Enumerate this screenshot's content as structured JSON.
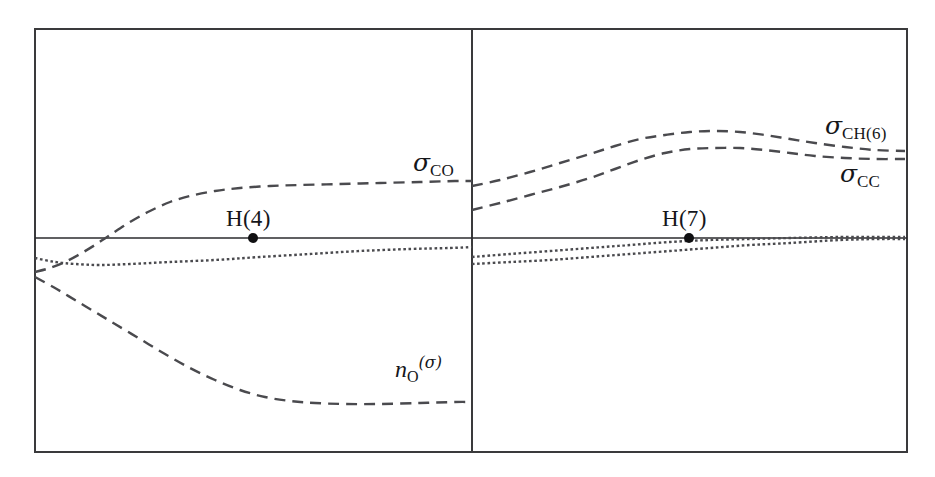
{
  "figure": {
    "background_color": "#ffffff",
    "frame_color": "#3a3a3c",
    "curve_color": "#4a4a4e",
    "axis_color": "#2b2b2e",
    "marker_color": "#101012"
  },
  "labels": {
    "sigma_co": {
      "symbol": "σ",
      "subscript": "CO",
      "x": 413,
      "y": 150
    },
    "n_o_sigma": {
      "symbol": "n",
      "subscript": "O",
      "superscript": "(σ)",
      "x": 395,
      "y": 355
    },
    "sigma_ch6": {
      "symbol": "σ",
      "subscript": "CH(6)",
      "x": 825,
      "y": 113
    },
    "sigma_cc": {
      "symbol": "σ",
      "subscript": "CC",
      "x": 840,
      "y": 161
    },
    "h4": {
      "text": "H(4)",
      "x": 226,
      "y": 207
    },
    "h7": {
      "text": "H(7)",
      "x": 662,
      "y": 207
    }
  },
  "chart_data": {
    "type": "line",
    "title": "",
    "xlabel": "",
    "ylabel": "",
    "grid": false,
    "legend": "inline-annotations",
    "axis_ranges": {
      "x_px": [
        35,
        907
      ],
      "y_px": [
        29,
        452
      ]
    },
    "baseline_y_px": 238,
    "panel_divider_x_px": 472,
    "panels": [
      {
        "name": "left-panel",
        "x_px": [
          35,
          472
        ],
        "series": [
          {
            "name": "σ_CO",
            "label": "σCO",
            "style": "dashed",
            "points_px": [
              [
                35,
                272
              ],
              [
                50,
                268
              ],
              [
                65,
                262
              ],
              [
                80,
                254
              ],
              [
                95,
                245
              ],
              [
                110,
                235
              ],
              [
                130,
                222
              ],
              [
                150,
                211
              ],
              [
                170,
                202
              ],
              [
                190,
                196
              ],
              [
                215,
                191
              ],
              [
                240,
                188
              ],
              [
                270,
                186
              ],
              [
                300,
                185
              ],
              [
                340,
                184
              ],
              [
                380,
                183
              ],
              [
                420,
                182
              ],
              [
                455,
                181
              ],
              [
                472,
                181
              ]
            ]
          },
          {
            "name": "n_O(σ)",
            "label": "nO(σ)",
            "style": "dashed",
            "points_px": [
              [
                35,
                277
              ],
              [
                55,
                288
              ],
              [
                75,
                300
              ],
              [
                95,
                312
              ],
              [
                115,
                324
              ],
              [
                140,
                339
              ],
              [
                165,
                354
              ],
              [
                190,
                368
              ],
              [
                215,
                380
              ],
              [
                240,
                390
              ],
              [
                265,
                397
              ],
              [
                290,
                401
              ],
              [
                315,
                403
              ],
              [
                345,
                404
              ],
              [
                380,
                404
              ],
              [
                420,
                403
              ],
              [
                455,
                402
              ],
              [
                472,
                402
              ]
            ]
          },
          {
            "name": "dotted-1",
            "label": "",
            "style": "dotted",
            "points_px": [
              [
                35,
                258
              ],
              [
                55,
                262
              ],
              [
                75,
                264
              ],
              [
                100,
                265
              ],
              [
                130,
                264
              ],
              [
                170,
                262
              ],
              [
                215,
                260
              ],
              [
                260,
                257
              ],
              [
                310,
                254
              ],
              [
                360,
                251
              ],
              [
                410,
                249
              ],
              [
                450,
                248
              ],
              [
                472,
                247
              ]
            ]
          }
        ],
        "markers": [
          {
            "label": "H(4)",
            "x_px": 253,
            "y_px": 238
          }
        ]
      },
      {
        "name": "right-panel",
        "x_px": [
          472,
          907
        ],
        "series": [
          {
            "name": "σ_CH(6)",
            "label": "σCH(6)",
            "style": "dashed",
            "points_px": [
              [
                472,
                186
              ],
              [
                500,
                180
              ],
              [
                530,
                172
              ],
              [
                560,
                163
              ],
              [
                590,
                154
              ],
              [
                615,
                146
              ],
              [
                640,
                139
              ],
              [
                665,
                135
              ],
              [
                690,
                132
              ],
              [
                715,
                131
              ],
              [
                740,
                132
              ],
              [
                765,
                135
              ],
              [
                790,
                139
              ],
              [
                815,
                143
              ],
              [
                845,
                147
              ],
              [
                875,
                150
              ],
              [
                905,
                151
              ]
            ]
          },
          {
            "name": "σ_CC",
            "label": "σCC",
            "style": "dashed",
            "points_px": [
              [
                472,
                210
              ],
              [
                500,
                203
              ],
              [
                530,
                195
              ],
              [
                560,
                187
              ],
              [
                590,
                178
              ],
              [
                615,
                169
              ],
              [
                640,
                160
              ],
              [
                665,
                153
              ],
              [
                690,
                149
              ],
              [
                715,
                148
              ],
              [
                740,
                148
              ],
              [
                765,
                150
              ],
              [
                790,
                153
              ],
              [
                815,
                156
              ],
              [
                845,
                158
              ],
              [
                875,
                159
              ],
              [
                905,
                159
              ]
            ]
          },
          {
            "name": "dotted-1",
            "label": "",
            "style": "dotted",
            "points_px": [
              [
                472,
                257
              ],
              [
                510,
                254
              ],
              [
                550,
                251
              ],
              [
                590,
                248
              ],
              [
                630,
                245
              ],
              [
                670,
                242
              ],
              [
                710,
                240
              ],
              [
                750,
                239
              ],
              [
                790,
                238
              ],
              [
                840,
                237
              ],
              [
                880,
                237
              ],
              [
                905,
                237
              ]
            ]
          },
          {
            "name": "dotted-2",
            "label": "",
            "style": "dotted",
            "points_px": [
              [
                472,
                264
              ],
              [
                510,
                262
              ],
              [
                550,
                260
              ],
              [
                590,
                257
              ],
              [
                630,
                254
              ],
              [
                670,
                251
              ],
              [
                710,
                248
              ],
              [
                750,
                245
              ],
              [
                790,
                243
              ],
              [
                840,
                240
              ],
              [
                880,
                239
              ],
              [
                905,
                239
              ]
            ]
          }
        ],
        "markers": [
          {
            "label": "H(7)",
            "x_px": 689,
            "y_px": 238
          }
        ]
      }
    ]
  }
}
